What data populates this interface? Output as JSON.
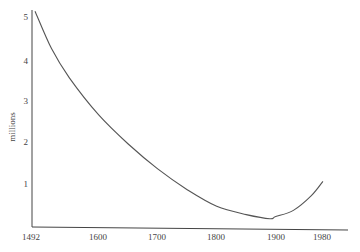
{
  "chart_data": {
    "type": "line",
    "title": "",
    "xlabel": "",
    "ylabel": "millions",
    "x_ticks": [
      "1492",
      "1600",
      "1700",
      "1800",
      "1900",
      "1980"
    ],
    "y_ticks": [
      "1",
      "2",
      "3",
      "4",
      "5"
    ],
    "xlim": [
      1492,
      1990
    ],
    "ylim": [
      0,
      5.3
    ],
    "grid": false,
    "legend": null,
    "series": [
      {
        "name": "population",
        "x": [
          1492,
          1520,
          1550,
          1600,
          1650,
          1700,
          1750,
          1800,
          1850,
          1890,
          1900,
          1930,
          1960,
          1980
        ],
        "values": [
          5.2,
          4.3,
          3.6,
          2.7,
          2.0,
          1.4,
          0.9,
          0.5,
          0.3,
          0.2,
          0.25,
          0.4,
          0.75,
          1.1
        ]
      }
    ]
  }
}
